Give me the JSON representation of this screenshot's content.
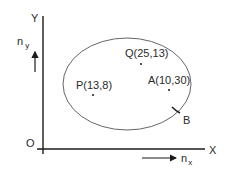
{
  "diagram": {
    "axes": {
      "y_label": "Y",
      "x_label": "X",
      "origin_label": "O"
    },
    "direction_vectors": {
      "ny": {
        "base": "n",
        "sub": "y"
      },
      "nx": {
        "base": "n",
        "sub": "x"
      }
    },
    "region": {
      "boundary_label": "B"
    },
    "points": [
      {
        "name": "P",
        "label": "P(13,8)"
      },
      {
        "name": "Q",
        "label": "Q(25,13)"
      },
      {
        "name": "A",
        "label": "A(10,30)"
      }
    ],
    "colors": {
      "line": "#1a1a1a",
      "ellipse": "#555555",
      "text": "#2a2a2a"
    }
  }
}
